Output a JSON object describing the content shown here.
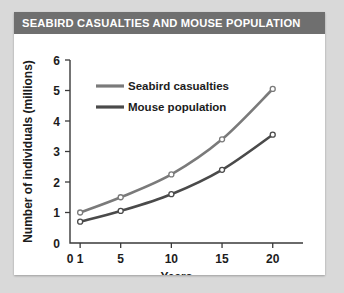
{
  "figure": {
    "title": "SEABIRD CASUALTIES AND MOUSE POPULATION",
    "title_bar_color": "#6f6f6f",
    "title_text_color": "#ffffff",
    "background": "#ffffff",
    "page_background": "#d9d9d9"
  },
  "chart_data": {
    "type": "line",
    "title": "SEABIRD CASUALTIES AND MOUSE POPULATION",
    "xlabel": "Years",
    "ylabel": "Number of individuals (millions)",
    "x": [
      1,
      5,
      10,
      15,
      20
    ],
    "xtick_labels": [
      "0",
      "1",
      "5",
      "10",
      "15",
      "20"
    ],
    "xtick_values": [
      0,
      1,
      5,
      10,
      15,
      20
    ],
    "ytick_labels": [
      "0",
      "1",
      "2",
      "3",
      "4",
      "5",
      "6"
    ],
    "ytick_values": [
      0,
      1,
      2,
      3,
      4,
      5,
      6
    ],
    "xlim": [
      0,
      22
    ],
    "ylim": [
      0,
      6
    ],
    "grid": false,
    "legend_position": "upper-left-inside",
    "series": [
      {
        "name": "Seabird casualties",
        "color": "#7a7a7a",
        "marker": "open-circle",
        "values": [
          1.0,
          1.5,
          2.25,
          3.4,
          5.05
        ]
      },
      {
        "name": "Mouse population",
        "color": "#4a4a4a",
        "marker": "open-circle",
        "values": [
          0.7,
          1.05,
          1.6,
          2.4,
          3.55
        ]
      }
    ]
  }
}
